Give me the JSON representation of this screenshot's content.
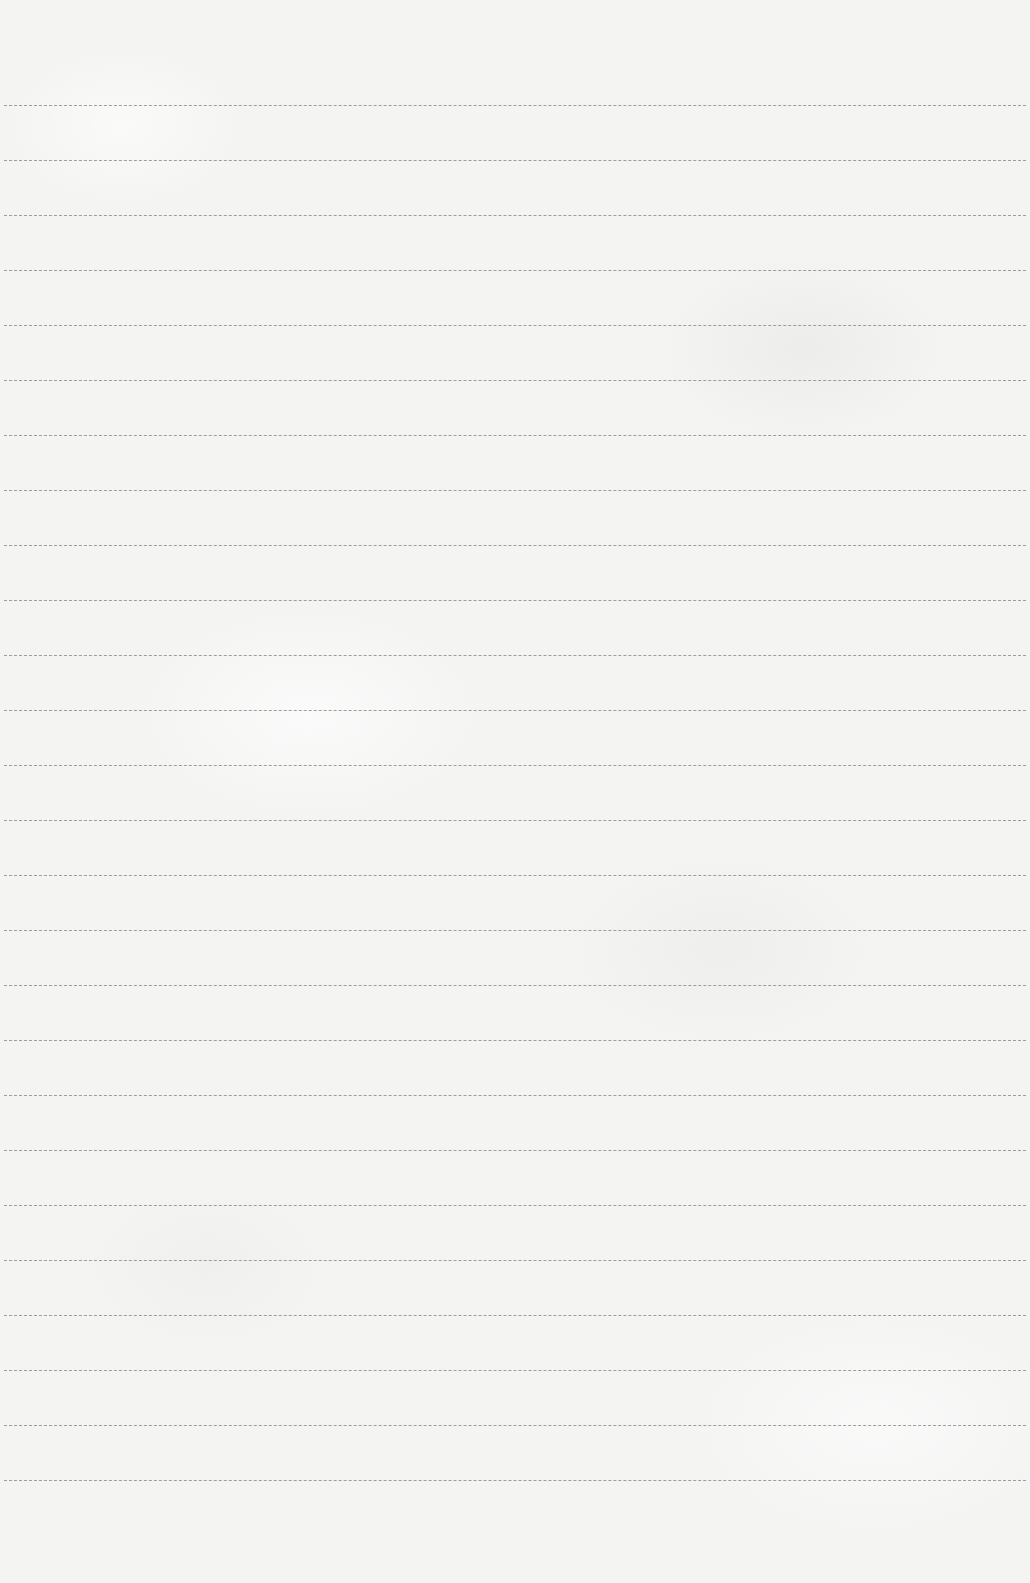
{
  "document": {
    "type": "blank-lined-paper",
    "background_color": "#f4f4f3",
    "line_color": "#8e8e8c",
    "line_count": 26,
    "first_line_y": 105,
    "line_spacing": 55,
    "text_content": ""
  }
}
